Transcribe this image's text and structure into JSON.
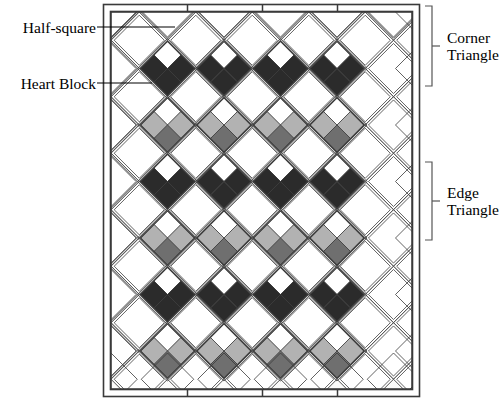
{
  "figure": {
    "type": "quilt-pattern-schematic"
  },
  "labels": {
    "half_square": "Half-square",
    "heart_block": "Heart Block",
    "corner_triangle_line1": "Corner",
    "corner_triangle_line2": "Triangle",
    "edge_triangle_line1": "Edge",
    "edge_triangle_line2": "Triangle"
  },
  "colors": {
    "dark": "#2b2b2b",
    "light_grey": "#b2b2b2",
    "medium_grey": "#6f6f6f",
    "white": "#ffffff",
    "off_white": "#f7f7f5",
    "outline": "#3a3a3a",
    "background": "#ffffff",
    "label_text": "#000000"
  },
  "quilt": {
    "frame": {
      "x": 103,
      "y": 4,
      "width": 317,
      "height": 393
    },
    "inner": {
      "x": 111,
      "y": 12,
      "width": 301,
      "height": 377
    },
    "grid": {
      "heart_columns": 4,
      "heart_rows": 6,
      "diagonal_cell": 56.5
    },
    "heart_rows_palette": [
      {
        "row": 1,
        "side": "#2b2b2b",
        "bottom": "#2b2b2b",
        "top": "#ffffff"
      },
      {
        "row": 2,
        "side": "#b2b2b2",
        "bottom": "#6f6f6f",
        "top": "#ffffff"
      },
      {
        "row": 3,
        "side": "#2b2b2b",
        "bottom": "#2b2b2b",
        "top": "#ffffff"
      },
      {
        "row": 4,
        "side": "#b2b2b2",
        "bottom": "#6f6f6f",
        "top": "#ffffff"
      },
      {
        "row": 5,
        "side": "#2b2b2b",
        "bottom": "#2b2b2b",
        "top": "#ffffff"
      },
      {
        "row": 6,
        "side": "#b2b2b2",
        "bottom": "#6f6f6f",
        "top": "#ffffff"
      }
    ]
  },
  "leaders": {
    "half_square": {
      "from_x": 97,
      "from_y": 27,
      "to_x": 170,
      "to_y": 27,
      "elbow_y": 47
    },
    "heart_block": {
      "from_x": 97,
      "from_y": 83,
      "to_x": 150,
      "to_y": 83,
      "elbow_y": 95
    }
  },
  "brackets": {
    "corner_triangle": {
      "x": 432,
      "y_top": 6,
      "y_bottom": 86,
      "tick_y": 46
    },
    "edge_triangle": {
      "x": 432,
      "y_top": 162,
      "y_bottom": 240,
      "tick_y": 201
    }
  }
}
